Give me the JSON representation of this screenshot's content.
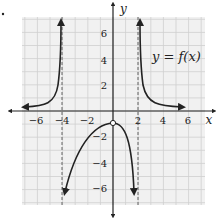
{
  "chart_data": {
    "type": "line",
    "title": "",
    "function_label": "y = f(x)",
    "xlabel": "x",
    "ylabel": "y",
    "xlim": [
      -7,
      7
    ],
    "ylim": [
      -7,
      7
    ],
    "grid": true,
    "x_ticks": [
      -6,
      -4,
      -2,
      2,
      4,
      6
    ],
    "y_ticks": [
      6,
      4,
      2,
      -2,
      -4,
      -6
    ],
    "vertical_asymptotes": [
      -4,
      2
    ],
    "horizontal_asymptote": 0,
    "open_points": [
      {
        "x": 0,
        "y": -1
      }
    ],
    "series": [
      {
        "name": "left branch",
        "points": [
          [
            -7,
            0.3
          ],
          [
            -6,
            0.5
          ],
          [
            -5,
            1.2
          ],
          [
            -4.5,
            3
          ],
          [
            -4.3,
            7
          ]
        ],
        "end_arrows": true
      },
      {
        "name": "middle branch",
        "points": [
          [
            -3.8,
            -6.5
          ],
          [
            -3,
            -3.5
          ],
          [
            -2,
            -2
          ],
          [
            -1,
            -1.2
          ],
          [
            0,
            -1
          ],
          [
            1,
            -2.2
          ],
          [
            1.5,
            -4
          ],
          [
            1.7,
            -6.5
          ]
        ],
        "end_arrows": true
      },
      {
        "name": "right branch",
        "points": [
          [
            2.3,
            7
          ],
          [
            2.5,
            3
          ],
          [
            3,
            1.2
          ],
          [
            4,
            0.5
          ],
          [
            6,
            0.3
          ]
        ],
        "end_arrows": true
      }
    ]
  },
  "labels": {
    "x_axis": "x",
    "y_axis": "y",
    "function": "y = f(x)",
    "x_ticks": [
      "−6",
      "−4",
      "−2",
      "2",
      "4",
      "6"
    ],
    "y_ticks": [
      "6",
      "4",
      "2",
      "−2",
      "−4",
      "−6"
    ]
  },
  "colors": {
    "grid": "#cfcfcf",
    "background": "#f1f1f1",
    "curve": "#222222",
    "asymptote": "#555555"
  }
}
